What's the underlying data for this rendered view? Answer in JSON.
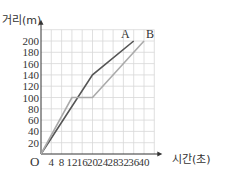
{
  "chart_data": {
    "type": "line",
    "title": "",
    "xlabel": "시간(초)",
    "ylabel": "거리(m)",
    "origin_label": "O",
    "x_ticks": [
      4,
      8,
      12,
      16,
      20,
      24,
      28,
      32,
      36,
      40
    ],
    "y_ticks": [
      20,
      40,
      60,
      80,
      100,
      120,
      140,
      160,
      180,
      200
    ],
    "xlim": [
      0,
      44
    ],
    "ylim": [
      0,
      220
    ],
    "grid": true,
    "series": [
      {
        "name": "A",
        "color": "#555555",
        "points": [
          [
            0,
            0
          ],
          [
            20,
            140
          ],
          [
            36,
            200
          ]
        ]
      },
      {
        "name": "B",
        "color": "#aaaaaa",
        "points": [
          [
            0,
            0
          ],
          [
            12,
            100
          ],
          [
            20,
            100
          ],
          [
            40,
            200
          ]
        ]
      }
    ]
  }
}
